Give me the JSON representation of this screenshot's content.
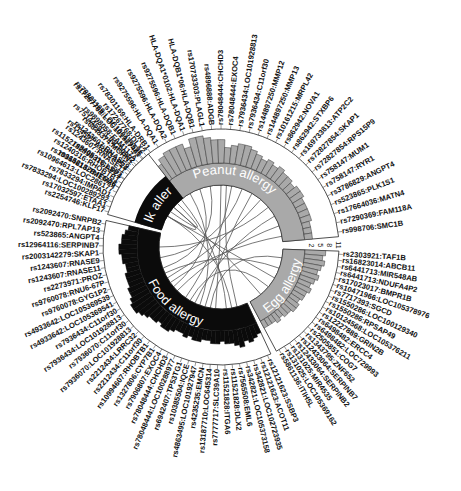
{
  "figure": {
    "type": "circos",
    "center": [
      221,
      247
    ],
    "colors": {
      "black_segment": "#0b0b0b",
      "grey_segment": "#a9a9a9",
      "bar_outline": "#333333",
      "link": "#555555",
      "label": "#111111",
      "segment_text": "#ffffff"
    }
  },
  "scale_ticks": [
    "2",
    "5",
    "8",
    "11"
  ],
  "segments": [
    {
      "name": "Peanut allergy",
      "fill": "#a9a9a9",
      "start_deg": -62,
      "end_deg": 85,
      "heights": [
        4,
        5,
        6,
        6,
        5,
        7,
        7,
        9,
        10,
        10,
        10,
        8,
        11,
        11,
        10,
        9,
        9,
        6,
        7,
        8,
        8,
        7,
        6,
        5,
        6,
        5,
        6,
        5,
        5,
        4,
        5,
        5,
        4,
        4,
        4,
        4,
        3,
        3,
        3
      ],
      "labels": [
        "rs11521828:ITGA6",
        "rs1152182898:ITGAP24",
        "rs114597:ARHGAP24",
        "rs75144597:LINC00992",
        "rs78301169:LOC100129526",
        "rs78301169:HLA-DRB1",
        "rs9275596:HLA-DQA1",
        "rs9275596:HLA-DQA2",
        "rs9275596:HLA-DQB1",
        "HLA-DQA1*0102:HLA-DQA1",
        "HLA-DQB1*06:HLA-DQB1",
        "rs170733303:PLAGL1",
        "rs4896888:ADGB",
        "rs78048444:CHCHD3",
        "rs78048444:EXOC4",
        "rs7936434:LOC101928813",
        "rs7936434:C11orf30",
        "rs144897250:MMP12",
        "rs144897250:MMP13",
        "rs10161215:MRPL42",
        "rs862942:NOVA1",
        "rs862942:STXBP6",
        "rs169733813:ATP2C2",
        "rs72827854:SKAP1",
        "rs72827854:RPS15P9",
        "rs758147:MUM1",
        "rs758147:RYR1",
        "rs3786829:ANGPT4",
        "rs523865:PLK1S1",
        "rs17664036:MATN4",
        "rs7290369:FAM118A",
        "rs998706:SMC1B"
      ]
    },
    {
      "name": "Egg allergy",
      "fill": "#a9a9a9",
      "start_deg": 92,
      "end_deg": 152,
      "heights": [
        8,
        7,
        8,
        7,
        6,
        7,
        6,
        5,
        6,
        5,
        5,
        4,
        5,
        5,
        4,
        4,
        3,
        4,
        3,
        3,
        3
      ],
      "labels": [
        "rs2303921:TAF1B",
        "rs16823014:ABCB11",
        "rs6441713:MIR548AB",
        "rs6441713:NDUFA4P2",
        "rs17023017:BMPR1B",
        "rs10471966:LOC105378976",
        "rs7717393:SGCD",
        "rs1550286:LOC100129340",
        "rs1550286:RPSAP49",
        "rs10124568:LOC105376211",
        "rs12227889:GRIN2B",
        "rs6498482:ERCC4",
        "rs6498482:LOC729993",
        "rs2505851:COG7",
        "rs1343795:ZNF652",
        "rs12433064:SERPINB7",
        "rs12433064:SERPINB2",
        "rs131025:MIR4535",
        "rs131025:LOC105369162",
        "rs5861136:ITIH5L"
      ]
    },
    {
      "name": "Food allergy",
      "fill": "#0b0b0b",
      "start_deg": 155,
      "end_deg": 283,
      "heights": [
        4,
        5,
        6,
        5,
        7,
        6,
        5,
        5,
        4,
        5,
        5,
        4,
        4,
        5,
        5,
        4,
        5,
        4,
        4,
        5,
        6,
        6,
        5,
        6,
        6,
        7,
        8,
        9,
        9,
        8,
        7,
        7,
        6,
        6,
        6,
        5,
        5,
        6,
        6,
        7,
        7,
        6,
        6,
        5,
        4
      ],
      "labels": [
        "rs12121623:SSBP3",
        "rs12121623:ACOT11",
        "rs342821:LOC102723935",
        "rs342821:LOC105373158",
        "rs7565508:EML6",
        "rs11521828:DLX2",
        "rs11521828:ITGA6",
        "rs7777717:SLC39A10",
        "rs13187710:LOC645314",
        "rs4235235:EMCN",
        "rs4863495:LOC101927947",
        "rs10385504:IQCE",
        "rs6942407:TP53TG1",
        "rs78048444:LOC100288977",
        "rs78048444:CHCHD3",
        "rs7906807:EXOC4",
        "rs1327806:CYP7B1",
        "rs10994607:RHOBTB1",
        "rs2212434:C11orf30",
        "rs2212434:LRRC32",
        "rs7936070:LOC101928813",
        "rs7936070:C11orf30",
        "rs7936434:LOC101928813",
        "rs7936434:C11orf30",
        "rs4933642:LOC105369541",
        "rs4933642:LOC105369539",
        "rs9760078:GYG1P2",
        "rs9760078:RNU6-67P",
        "rs2273971:PROZ",
        "rs1243607:RNASE11",
        "rs1243607:RNASE9",
        "rs2003142279:SKAP1",
        "rs12964116:SERPINB7",
        "rs523865:ANGPT4",
        "rs2092470:RPL7AP13",
        "rs2092470:SNRPB2"
      ]
    },
    {
      "name": "Milk allergy",
      "fill": "#0b0b0b",
      "start_deg": 286,
      "end_deg": 322,
      "heights": [],
      "labels": [
        "rs2254746:KLF17",
        "rs17032597:ETAA1",
        "rs7833294:LOC100289292",
        "rs7833294:IMPAD1",
        "rs10964613:LOC286177",
        "rs10964613:TMEM26",
        "rs1240316:RHOBTB1",
        "rs8405316:LSP1",
        "rs1243607:RNASE11",
        "rs1243607:RNASE9",
        "rs6848374:MGRN1",
        "rs9898058:FAM117A",
        "rs17267768:LOC101927481",
        "rs17267768:DLX2"
      ]
    }
  ],
  "links": [
    [
      -40,
      175
    ],
    [
      -30,
      200
    ],
    [
      -20,
      230
    ],
    [
      -10,
      250
    ],
    [
      0,
      185
    ],
    [
      10,
      215
    ],
    [
      20,
      260
    ],
    [
      30,
      195
    ],
    [
      40,
      240
    ],
    [
      50,
      270
    ],
    [
      60,
      205
    ],
    [
      70,
      225
    ],
    [
      100,
      190
    ],
    [
      110,
      245
    ],
    [
      120,
      300
    ],
    [
      130,
      210
    ],
    [
      -50,
      300
    ],
    [
      -55,
      315
    ],
    [
      300,
      170
    ],
    [
      310,
      140
    ],
    [
      80,
      235
    ],
    [
      5,
      165
    ]
  ]
}
